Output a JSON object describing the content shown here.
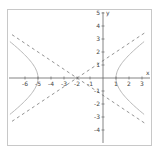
{
  "chart_data": {
    "type": "line",
    "title": "",
    "xlabel": "x",
    "ylabel": "y",
    "xlim": [
      -7,
      3.3
    ],
    "ylim": [
      -5,
      5
    ],
    "x_ticks": [
      -6,
      -5,
      -4,
      -3,
      -2,
      -1,
      1,
      2,
      3
    ],
    "y_ticks": [
      -4,
      -3,
      -2,
      -1,
      1,
      2,
      3,
      4,
      5
    ],
    "grid": false,
    "legend": null,
    "series": [
      {
        "name": "hyperbola",
        "style": "solid",
        "color": "#b8b8b8",
        "equation": "(x+2)^2/9 - y^2/4 = 1",
        "center": [
          -2,
          0
        ],
        "vertices": [
          [
            -5,
            0
          ],
          [
            1,
            0
          ]
        ]
      },
      {
        "name": "asymptote-1",
        "style": "dashed",
        "color": "#888888",
        "equation": "y = (2/3)(x+2)"
      },
      {
        "name": "asymptote-2",
        "style": "dashed",
        "color": "#888888",
        "equation": "y = -(2/3)(x+2)"
      }
    ]
  }
}
